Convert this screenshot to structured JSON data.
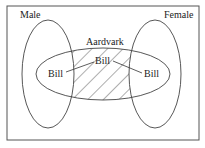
{
  "diagram": {
    "type": "venn",
    "sets": [
      {
        "name": "Male",
        "label": "Male"
      },
      {
        "name": "Female",
        "label": "Female"
      },
      {
        "name": "Aardvark",
        "label": "Aardvark"
      }
    ],
    "instances": [
      {
        "label": "Bill",
        "region": "Male ∩ Aardvark"
      },
      {
        "label": "Bill",
        "region": "Aardvark only (shaded)"
      },
      {
        "label": "Bill",
        "region": "Female ∩ Aardvark"
      }
    ],
    "shaded_region": "Aardvark minus Male minus Female",
    "colors": {
      "stroke": "#333333",
      "background": "#ffffff"
    }
  }
}
